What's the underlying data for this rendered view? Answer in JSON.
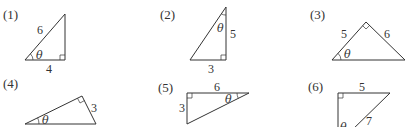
{
  "problems": [
    {
      "label": "(1)",
      "sides": [
        "6",
        "4"
      ],
      "angle": "θ"
    },
    {
      "label": "(2)",
      "sides": [
        "5",
        "3"
      ],
      "angle": "θ"
    },
    {
      "label": "(3)",
      "sides": [
        "5",
        "6"
      ],
      "angle": "θ"
    },
    {
      "label": "(4)",
      "sides": [
        "3"
      ],
      "angle": "θ"
    },
    {
      "label": "(5)",
      "sides": [
        "6",
        "3"
      ],
      "angle": "θ"
    },
    {
      "label": "(6)",
      "sides": [
        "5",
        "7"
      ],
      "angle": "θ"
    }
  ]
}
